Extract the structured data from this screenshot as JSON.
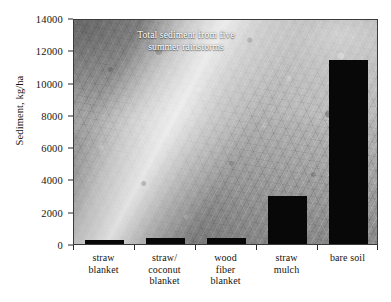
{
  "chart_data": {
    "type": "bar",
    "title": "",
    "annotation": "Total sediment from five\nsummer rainstorms",
    "categories": [
      "straw\nblanket",
      "straw/\ncoconut\nblanket",
      "wood\nfiber\nblanket",
      "straw\nmulch",
      "bare soil"
    ],
    "values": [
      250,
      400,
      400,
      3000,
      11400
    ],
    "xlabel": "",
    "ylabel": "Sediment, kg/ha",
    "ylim": [
      0,
      14000
    ],
    "yticks": [
      0,
      2000,
      4000,
      6000,
      8000,
      10000,
      12000,
      14000
    ],
    "ytick_labels": [
      "0",
      "2000",
      "4000",
      "6000",
      "8000",
      "10000",
      "12000",
      "14000"
    ],
    "grid": false,
    "legend": "none",
    "bar_color": "#080808",
    "background": "photograph-grayscale-erosion-blanket"
  },
  "axis": {
    "y_title": "Sediment, kg/ha"
  },
  "colors": {
    "bar": "#080808",
    "axis": "#2a2a28",
    "text": "#16150f",
    "annotation_text": "#ffffff",
    "page_background": "#ffffff"
  }
}
